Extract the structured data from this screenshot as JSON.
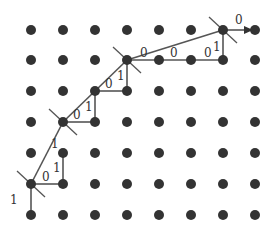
{
  "diagram": {
    "grid": {
      "cols_x": [
        31,
        63,
        95,
        127,
        159,
        191,
        223,
        255
      ],
      "rows_y": [
        30,
        60,
        91,
        122,
        153,
        184,
        215
      ],
      "dot_color": "#333333",
      "dot_radius": 5
    },
    "edges": [
      {
        "from": [
          31,
          215
        ],
        "to": [
          31,
          184
        ],
        "label": "1",
        "lx": 10,
        "ly": 204
      },
      {
        "from": [
          31,
          184
        ],
        "to": [
          63,
          184
        ],
        "label": "0",
        "lx": 42,
        "ly": 181
      },
      {
        "from": [
          63,
          184
        ],
        "to": [
          63,
          153
        ],
        "label": "1",
        "lx": 53,
        "ly": 172
      },
      {
        "from": [
          31,
          184
        ],
        "to": [
          63,
          122
        ],
        "label": "1",
        "lx": 51,
        "ly": 148
      },
      {
        "from": [
          63,
          122
        ],
        "to": [
          95,
          122
        ],
        "label": "",
        "lx": 0,
        "ly": 0
      },
      {
        "from": [
          95,
          122
        ],
        "to": [
          95,
          91
        ],
        "label": "1",
        "lx": 85,
        "ly": 111
      },
      {
        "from": [
          63,
          122
        ],
        "to": [
          95,
          91
        ],
        "label": "0",
        "lx": 73,
        "ly": 119
      },
      {
        "from": [
          95,
          91
        ],
        "to": [
          127,
          91
        ],
        "label": "",
        "lx": 0,
        "ly": 0
      },
      {
        "from": [
          127,
          91
        ],
        "to": [
          127,
          60
        ],
        "label": "1",
        "lx": 117,
        "ly": 80
      },
      {
        "from": [
          95,
          91
        ],
        "to": [
          127,
          60
        ],
        "label": "0",
        "lx": 105,
        "ly": 88
      },
      {
        "from": [
          127,
          60
        ],
        "to": [
          223,
          60
        ],
        "label": "",
        "lx": 0,
        "ly": 0
      },
      {
        "from": [
          223,
          60
        ],
        "to": [
          223,
          30
        ],
        "label": "1",
        "lx": 213,
        "ly": 51
      },
      {
        "from": [
          127,
          60
        ],
        "to": [
          223,
          30
        ],
        "label": "0",
        "lx": 140,
        "ly": 57
      },
      {
        "extra_label": true,
        "label": "0",
        "lx": 170,
        "ly": 57
      },
      {
        "extra_label": true,
        "label": "0",
        "lx": 204,
        "ly": 57
      }
    ],
    "arrow": {
      "from": [
        223,
        30
      ],
      "to": [
        253,
        30
      ],
      "label": "0",
      "lx": 235,
      "ly": 24
    },
    "crossed_nodes": [
      [
        31,
        184
      ],
      [
        63,
        122
      ],
      [
        127,
        60
      ],
      [
        223,
        30
      ]
    ],
    "line_color": "#555555"
  }
}
